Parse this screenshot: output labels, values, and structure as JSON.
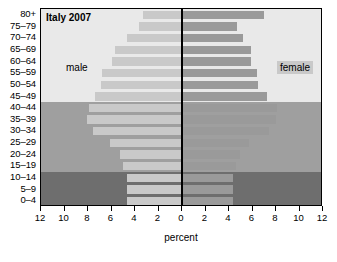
{
  "chart_data": {
    "type": "bar",
    "subtype": "population-pyramid",
    "title": "Italy 2007",
    "xlabel": "percent",
    "ylabel": "",
    "xlim": [
      -12,
      12
    ],
    "xtick_labels": [
      "12",
      "10",
      "8",
      "6",
      "4",
      "2",
      "0",
      "2",
      "4",
      "6",
      "8",
      "10",
      "12"
    ],
    "xtick_values": [
      -12,
      -10,
      -8,
      -6,
      -4,
      -2,
      0,
      2,
      4,
      6,
      8,
      10,
      12
    ],
    "grid": false,
    "legend_position": "inside",
    "categories": [
      "0–4",
      "5–9",
      "10–14",
      "15–19",
      "20–24",
      "25–29",
      "30–34",
      "35–39",
      "40–44",
      "45–49",
      "50–54",
      "55–59",
      "60–64",
      "65–69",
      "70–74",
      "75–79",
      "80+"
    ],
    "series": [
      {
        "name": "male",
        "color": "#c9c9c9",
        "values": [
          4.7,
          4.7,
          4.7,
          5.0,
          5.3,
          6.1,
          7.6,
          8.1,
          7.9,
          7.4,
          6.9,
          6.8,
          6.0,
          5.7,
          4.7,
          3.7,
          3.3
        ]
      },
      {
        "name": "female",
        "color": "#9a9a9a",
        "values": [
          4.3,
          4.3,
          4.3,
          4.6,
          4.9,
          5.7,
          7.4,
          8.0,
          8.1,
          7.2,
          6.5,
          6.4,
          5.9,
          5.9,
          5.2,
          4.7,
          7.0
        ]
      }
    ],
    "bands": [
      {
        "name": "young",
        "from": "0–4",
        "to": "10–14",
        "color": "#6e6e6e"
      },
      {
        "name": "working-age",
        "from": "15–19",
        "to": "40–44",
        "color": "#9f9f9f"
      },
      {
        "name": "older",
        "from": "45–49",
        "to": "80+",
        "color": "#e9e9e9"
      }
    ],
    "annotations": [
      {
        "name": "male-label",
        "text": "male",
        "side": "left"
      },
      {
        "name": "female-label",
        "text": "female",
        "side": "right"
      }
    ]
  },
  "figure": {
    "top_title": "",
    "axis_title": "percent"
  }
}
